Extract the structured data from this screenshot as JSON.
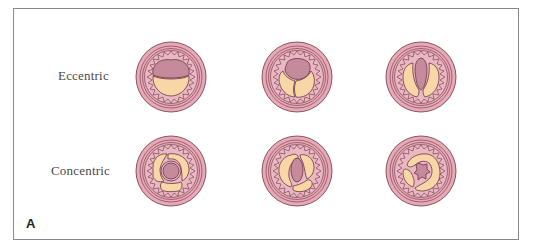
{
  "figure": {
    "panel_letter": "A",
    "rows": [
      {
        "label": "Eccentric",
        "vessels": [
          "eccentric-crescent",
          "eccentric-bilobed",
          "eccentric-slit"
        ]
      },
      {
        "label": "Concentric",
        "vessels": [
          "concentric-ring",
          "concentric-oval",
          "concentric-stellate"
        ]
      }
    ]
  },
  "colors": {
    "adventitia": "#e7a9b6",
    "media": "#eab8c2",
    "lumen": "#c68a9d",
    "plaque": "#f8d6a6",
    "outline": "#6b3344",
    "frame": "#8a8a8a"
  }
}
